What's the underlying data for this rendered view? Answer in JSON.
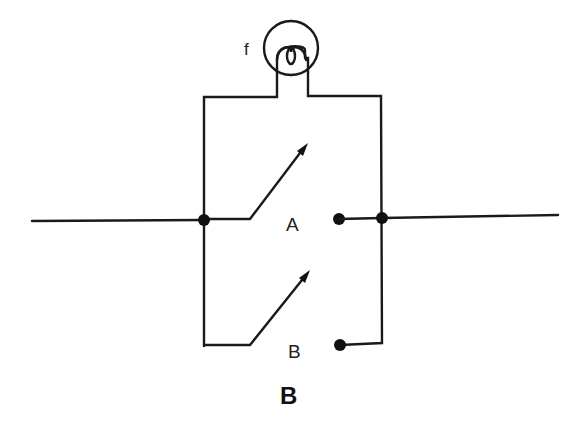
{
  "diagram": {
    "type": "parallel switch circuit with lamp",
    "caption": "B",
    "lamp": {
      "label": "f"
    },
    "switches": [
      {
        "id": "A",
        "label": "A",
        "state": "open"
      },
      {
        "id": "B",
        "label": "B",
        "state": "open"
      }
    ],
    "colors": {
      "ink": "#1a1a1a",
      "background": "#ffffff"
    }
  }
}
